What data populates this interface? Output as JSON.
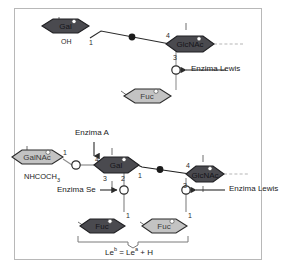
{
  "figure": {
    "colors": {
      "dark_sugar": "#4a4a4f",
      "light_sugar": "#c3c3c3",
      "outline": "#2b2b2b",
      "line": "#8d8d8d",
      "text": "#2b2b2b",
      "frame": "#b8b8b8"
    }
  },
  "top_panel": {
    "sugars": [
      {
        "name": "gal",
        "label": "Gal",
        "shade": "dark"
      },
      {
        "name": "glcnac",
        "label": "GlcNAc",
        "shade": "dark"
      },
      {
        "name": "fuc",
        "label": "Fuc",
        "shade": "light"
      }
    ],
    "numbers": {
      "gal_anomeric": "1",
      "glcnac_four": "4",
      "glcnac_three": "3"
    },
    "annotations": [
      {
        "name": "oh-label",
        "text": "OH"
      },
      {
        "name": "enzima-lewis-label",
        "text": "Enzima Lewis"
      }
    ]
  },
  "bottom_panel": {
    "sugars": [
      {
        "name": "galnac",
        "label": "GalNAc",
        "shade": "light"
      },
      {
        "name": "gal",
        "label": "Gal",
        "shade": "dark"
      },
      {
        "name": "glcnac",
        "label": "GlcNAc",
        "shade": "dark"
      },
      {
        "name": "fuc-left",
        "label": "Fuc",
        "shade": "dark"
      },
      {
        "name": "fuc-right",
        "label": "Fuc",
        "shade": "light"
      }
    ],
    "numbers": {
      "galnac_anomeric": "1",
      "gal_four": "4",
      "gal_three": "3",
      "gal_two": "2",
      "gal_one": "1",
      "glcnac_four": "4",
      "glcnac_three": "3",
      "fuc_left_one": "1",
      "fuc_right_one": "1"
    },
    "annotations": [
      {
        "name": "enzima-a-label",
        "text": "Enzima A"
      },
      {
        "name": "enzima-se-label",
        "text": "Enzima Se"
      },
      {
        "name": "enzima-lewis-label",
        "text": "Enzima Lewis"
      },
      {
        "name": "nhcoch3-label",
        "text": "NHCOCH"
      },
      {
        "name": "nhcoch3-sub",
        "text": "3"
      }
    ],
    "equation": {
      "left": "Le",
      "left_sup": "b",
      "operator": "=",
      "right": "Le",
      "right_sup": "a",
      "plus": "+ H"
    }
  }
}
